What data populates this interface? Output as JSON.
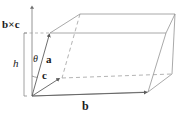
{
  "figure": {
    "type": "geometry-diagram",
    "background_color": "#ffffff",
    "line_color": "#8c8c8c",
    "label_color": "#1a1a1a",
    "labels": {
      "cross_product": "b×c",
      "height": "h",
      "angle": "θ",
      "vector_a": "a",
      "vector_b": "b",
      "vector_c": "c"
    },
    "elements": {
      "axis_name": "b-cross-c-axis",
      "bracket_name": "height-bracket",
      "solid_name": "parallelepiped"
    },
    "geometry": {
      "origin": [
        32,
        96
      ],
      "vector_a_tip": [
        50,
        33
      ],
      "vector_b_tip": [
        148,
        92
      ],
      "vector_c_tip": [
        60,
        78
      ],
      "top_back_left": [
        80,
        14
      ],
      "top_back_right": [
        175,
        14
      ],
      "top_front_right": [
        166,
        33
      ],
      "bottom_back_right": [
        172,
        74
      ],
      "axis_top": [
        32,
        4
      ],
      "axis_base": [
        32,
        96
      ],
      "bracket_x": 24,
      "bracket_top": 33,
      "bracket_bottom": 96
    }
  }
}
